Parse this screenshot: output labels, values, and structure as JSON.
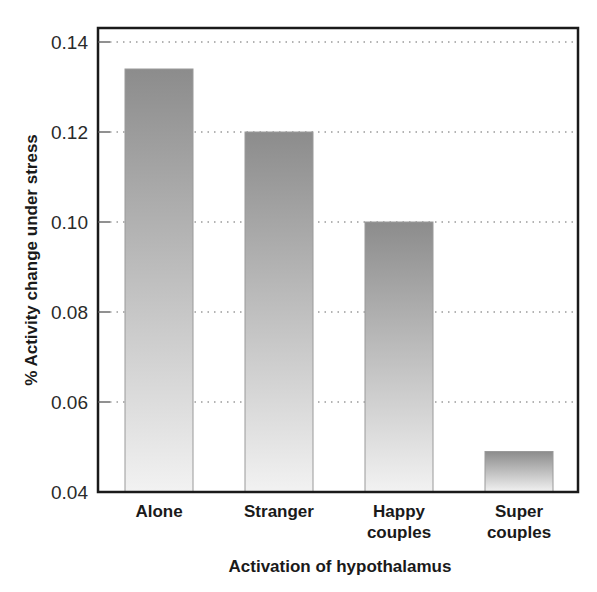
{
  "chart_data": {
    "type": "bar",
    "title": "",
    "xlabel": "Activation of hypothalamus",
    "ylabel": "% Activity change under stress",
    "categories": [
      [
        "Alone"
      ],
      [
        "Stranger"
      ],
      [
        "Happy",
        "couples"
      ],
      [
        "Super",
        "couples"
      ]
    ],
    "category_names": [
      "Alone",
      "Stranger",
      "Happy couples",
      "Super couples"
    ],
    "values": [
      0.134,
      0.12,
      0.1,
      0.049
    ],
    "ylim": [
      0.04,
      0.14
    ],
    "yticks": [
      0.04,
      0.06,
      0.08,
      0.1,
      0.12,
      0.14
    ],
    "ytick_labels": [
      "0.04",
      "0.06",
      "0.08",
      "0.10",
      "0.12",
      "0.14"
    ],
    "grid": "horizontal dotted",
    "legend": "none",
    "bar_gradient": {
      "top": "#8c8c8c",
      "bottom": "#f2f2f2",
      "outline": "#9a9a9a"
    },
    "frame_color": "#1a1a1a",
    "grid_color": "#9a9a9a"
  }
}
